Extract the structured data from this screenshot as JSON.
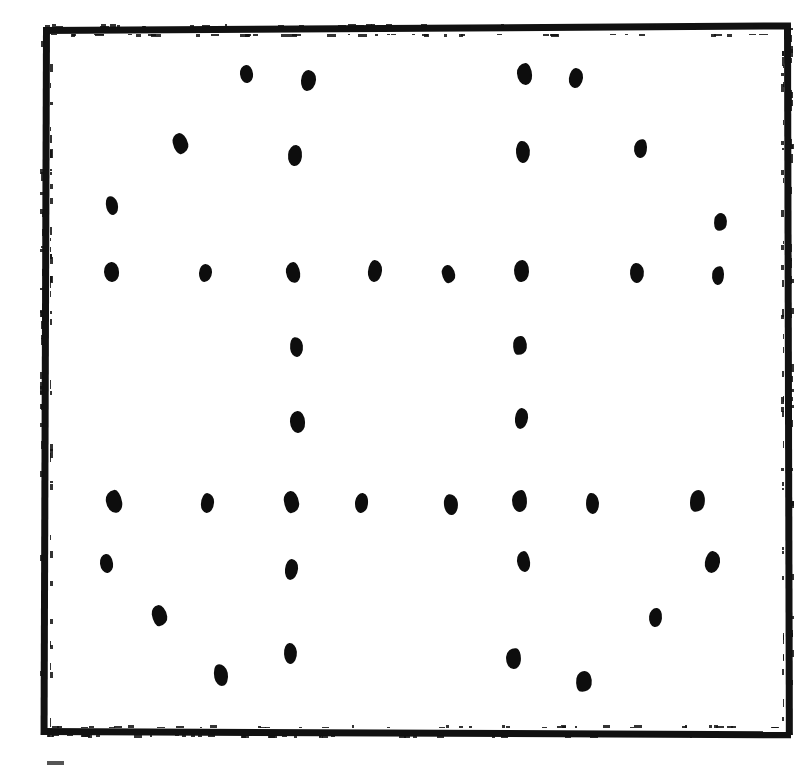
{
  "figure": {
    "kind": "dot-pattern-figure",
    "title": "Hand-drawn square frame enclosing a field of ink dots",
    "description": "A thick hand-inked rectangular border containing forty-five small irregular black dots arranged so that horizontal rows and vertical columns emerge from an otherwise scattered field.",
    "background_color": "#ffffff",
    "ink_color": "#0d0d0d",
    "dot_count": 45,
    "caption_sliver_text": ""
  },
  "frame": {
    "x": 43,
    "y": 27,
    "width": 748,
    "height": 708,
    "stroke_width": 7,
    "color": "#111111"
  },
  "chart_data": {
    "type": "scatter",
    "title": "Hand-drawn square frame enclosing a field of ink dots",
    "subtitle": "",
    "xlabel": "",
    "ylabel": "",
    "xlim": [
      43,
      791
    ],
    "ylim": [
      27,
      735
    ],
    "grid": false,
    "legend": null,
    "annotations": [],
    "marker": {
      "shape": "irregular-blob",
      "color": "#0d0d0d",
      "mean_width": 15,
      "mean_height": 20
    },
    "series": [
      {
        "name": "ink dots",
        "color": "#0d0d0d",
        "points": [
          {
            "x": 246,
            "y": 74,
            "w": 13,
            "h": 18,
            "rot": -6
          },
          {
            "x": 308,
            "y": 80,
            "w": 15,
            "h": 21,
            "rot": 4
          },
          {
            "x": 524,
            "y": 74,
            "w": 15,
            "h": 22,
            "rot": -3
          },
          {
            "x": 576,
            "y": 78,
            "w": 14,
            "h": 20,
            "rot": 7
          },
          {
            "x": 180,
            "y": 143,
            "w": 15,
            "h": 21,
            "rot": -12
          },
          {
            "x": 295,
            "y": 155,
            "w": 14,
            "h": 21,
            "rot": 6
          },
          {
            "x": 523,
            "y": 152,
            "w": 14,
            "h": 22,
            "rot": -5
          },
          {
            "x": 640,
            "y": 148,
            "w": 13,
            "h": 19,
            "rot": 9
          },
          {
            "x": 112,
            "y": 205,
            "w": 12,
            "h": 19,
            "rot": -14
          },
          {
            "x": 720,
            "y": 222,
            "w": 13,
            "h": 18,
            "rot": 10
          },
          {
            "x": 111,
            "y": 272,
            "w": 15,
            "h": 20,
            "rot": -4
          },
          {
            "x": 205,
            "y": 273,
            "w": 13,
            "h": 18,
            "rot": 3
          },
          {
            "x": 293,
            "y": 272,
            "w": 14,
            "h": 21,
            "rot": -7
          },
          {
            "x": 375,
            "y": 271,
            "w": 14,
            "h": 22,
            "rot": 5
          },
          {
            "x": 448,
            "y": 274,
            "w": 13,
            "h": 18,
            "rot": -9
          },
          {
            "x": 521,
            "y": 271,
            "w": 15,
            "h": 22,
            "rot": 2
          },
          {
            "x": 637,
            "y": 273,
            "w": 14,
            "h": 20,
            "rot": -5
          },
          {
            "x": 718,
            "y": 275,
            "w": 12,
            "h": 19,
            "rot": 8
          },
          {
            "x": 296,
            "y": 347,
            "w": 13,
            "h": 20,
            "rot": -6
          },
          {
            "x": 520,
            "y": 345,
            "w": 14,
            "h": 19,
            "rot": 6
          },
          {
            "x": 297,
            "y": 422,
            "w": 15,
            "h": 22,
            "rot": -3
          },
          {
            "x": 521,
            "y": 418,
            "w": 13,
            "h": 21,
            "rot": 5
          },
          {
            "x": 114,
            "y": 501,
            "w": 16,
            "h": 23,
            "rot": -8
          },
          {
            "x": 207,
            "y": 503,
            "w": 13,
            "h": 20,
            "rot": 4
          },
          {
            "x": 291,
            "y": 502,
            "w": 15,
            "h": 22,
            "rot": -6
          },
          {
            "x": 361,
            "y": 503,
            "w": 13,
            "h": 20,
            "rot": 7
          },
          {
            "x": 451,
            "y": 504,
            "w": 14,
            "h": 21,
            "rot": -10
          },
          {
            "x": 519,
            "y": 501,
            "w": 15,
            "h": 22,
            "rot": 3
          },
          {
            "x": 592,
            "y": 503,
            "w": 13,
            "h": 21,
            "rot": -4
          },
          {
            "x": 697,
            "y": 501,
            "w": 15,
            "h": 22,
            "rot": 11
          },
          {
            "x": 106,
            "y": 563,
            "w": 13,
            "h": 19,
            "rot": -7
          },
          {
            "x": 291,
            "y": 569,
            "w": 13,
            "h": 21,
            "rot": 5
          },
          {
            "x": 523,
            "y": 561,
            "w": 13,
            "h": 21,
            "rot": -5
          },
          {
            "x": 712,
            "y": 562,
            "w": 15,
            "h": 22,
            "rot": 8
          },
          {
            "x": 159,
            "y": 615,
            "w": 15,
            "h": 21,
            "rot": -9
          },
          {
            "x": 655,
            "y": 617,
            "w": 13,
            "h": 19,
            "rot": 6
          },
          {
            "x": 290,
            "y": 653,
            "w": 13,
            "h": 21,
            "rot": -4
          },
          {
            "x": 513,
            "y": 658,
            "w": 15,
            "h": 21,
            "rot": 5
          },
          {
            "x": 221,
            "y": 675,
            "w": 14,
            "h": 22,
            "rot": -11
          },
          {
            "x": 584,
            "y": 681,
            "w": 16,
            "h": 21,
            "rot": 9
          }
        ]
      }
    ]
  },
  "caption": {
    "visible_fragment": "",
    "note": "only the very top edge of a clipped caption glyph is visible at the page bottom-left"
  }
}
